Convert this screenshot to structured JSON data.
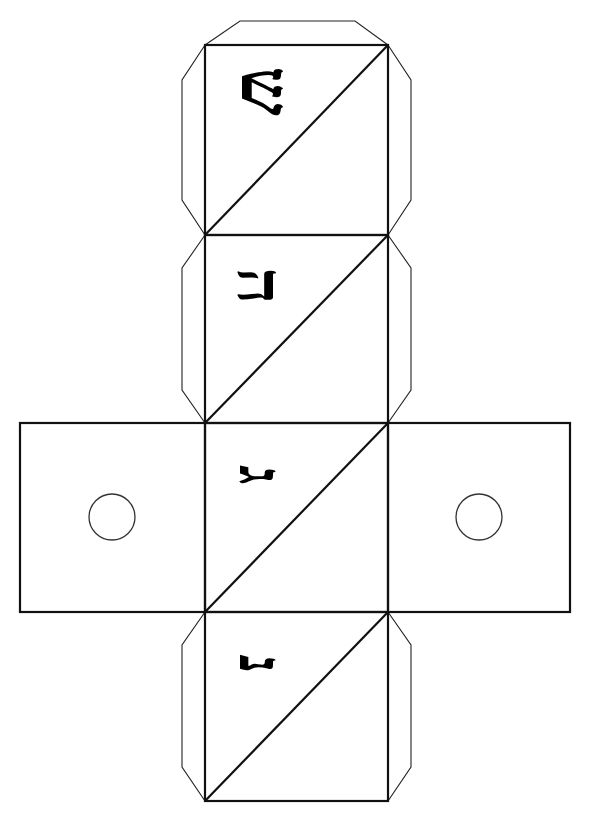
{
  "colors": {
    "line": "#111111",
    "background": "#ffffff",
    "letter": "#000000"
  },
  "faces": [
    {
      "id": "face-shin",
      "x": 205,
      "y": 45,
      "w": 183,
      "h": 190,
      "letter": "ש",
      "letter_name": "Shin",
      "diagonal": true
    },
    {
      "id": "face-hei",
      "x": 205,
      "y": 235,
      "w": 183,
      "h": 188,
      "letter": "ה",
      "letter_name": "Hei",
      "diagonal": true
    },
    {
      "id": "face-gimel",
      "x": 205,
      "y": 423,
      "w": 183,
      "h": 189,
      "letter": "ג",
      "letter_name": "Gimel",
      "diagonal": true
    },
    {
      "id": "face-nun",
      "x": 205,
      "y": 612,
      "w": 183,
      "h": 189,
      "letter": "נ",
      "letter_name": "Nun",
      "diagonal": true
    },
    {
      "id": "face-left",
      "x": 20,
      "y": 423,
      "w": 185,
      "h": 189,
      "hole": {
        "cx": 112,
        "cy": 517,
        "r": 23
      }
    },
    {
      "id": "face-right",
      "x": 388,
      "y": 423,
      "w": 182,
      "h": 189,
      "hole": {
        "cx": 479,
        "cy": 517,
        "r": 23
      }
    }
  ],
  "letters": [
    {
      "char": "ש",
      "name": "Shin",
      "x": 226,
      "y": 56,
      "w": 80,
      "h": 70,
      "size": 70,
      "rotate": 90
    },
    {
      "char": "ה",
      "name": "Hei",
      "x": 226,
      "y": 258,
      "w": 68,
      "h": 56,
      "size": 64,
      "rotate": 90
    },
    {
      "char": "ג",
      "name": "Gimel",
      "x": 226,
      "y": 452,
      "w": 70,
      "h": 46,
      "size": 60,
      "rotate": 90
    },
    {
      "char": "נ",
      "name": "Nun",
      "x": 226,
      "y": 640,
      "w": 70,
      "h": 48,
      "size": 60,
      "rotate": 90
    }
  ],
  "tabs": [
    {
      "id": "tab-top",
      "points": "205,45 240,21 355,21 388,45"
    },
    {
      "id": "tab-shin-left",
      "points": "205,45 182,80 182,200 205,235"
    },
    {
      "id": "tab-shin-right",
      "points": "388,45 411,80 411,200 388,235"
    },
    {
      "id": "tab-hei-left",
      "points": "205,235 182,268 182,390 205,423"
    },
    {
      "id": "tab-hei-right",
      "points": "388,235 411,268 411,390 388,423"
    },
    {
      "id": "tab-nun-left",
      "points": "205,612 182,645 182,767 205,801"
    },
    {
      "id": "tab-nun-right",
      "points": "388,612 411,645 411,767 388,801"
    }
  ]
}
